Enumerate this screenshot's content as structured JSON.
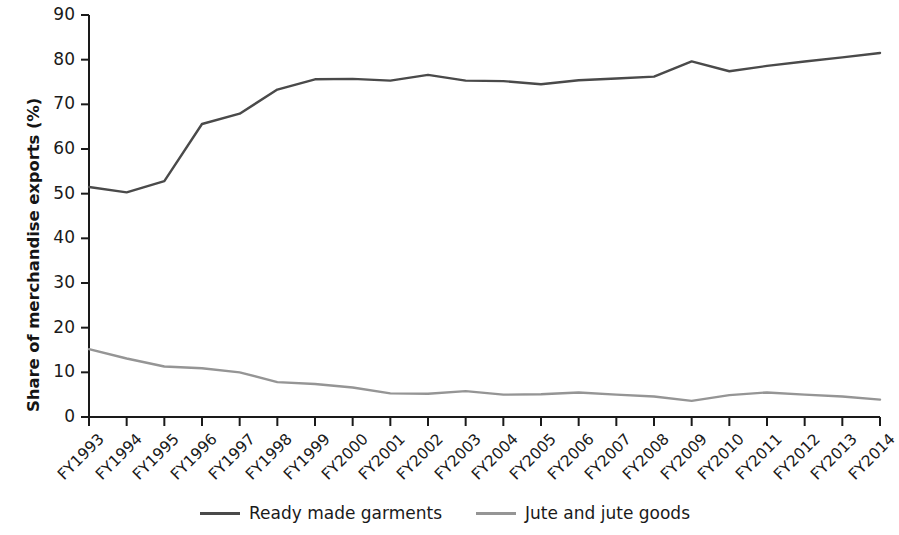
{
  "chart_data": {
    "type": "line",
    "title": "",
    "xlabel": "",
    "ylabel": "Share of merchandise exports (%)",
    "ylim": [
      0,
      90
    ],
    "yticks": [
      0,
      10,
      20,
      30,
      40,
      50,
      60,
      70,
      80,
      90
    ],
    "grid": false,
    "legend_position": "bottom-center",
    "categories": [
      "FY1993",
      "FY1994",
      "FY1995",
      "FY1996",
      "FY1997",
      "FY1998",
      "FY1999",
      "FY2000",
      "FY2001",
      "FY2002",
      "FY2003",
      "FY2004",
      "FY2005",
      "FY2006",
      "FY2007",
      "FY2008",
      "FY2009",
      "FY2010",
      "FY2011",
      "FY2012",
      "FY2013",
      "FY2014"
    ],
    "series": [
      {
        "name": "Ready made garments",
        "color": "#4a4a4a",
        "values": [
          51.5,
          50.3,
          52.8,
          65.6,
          67.9,
          73.3,
          75.6,
          75.7,
          75.3,
          76.6,
          75.3,
          75.2,
          74.5,
          75.4,
          75.8,
          76.2,
          79.6,
          77.4,
          78.6,
          79.6,
          80.5,
          81.5
        ]
      },
      {
        "name": "Jute and jute goods",
        "color": "#959595",
        "values": [
          15.2,
          13.1,
          11.3,
          10.9,
          10.0,
          7.8,
          7.4,
          6.6,
          5.3,
          5.2,
          5.8,
          5.0,
          5.1,
          5.5,
          5.0,
          4.6,
          3.6,
          4.9,
          5.5,
          5.0,
          4.6,
          3.9
        ]
      }
    ]
  },
  "legend": {
    "items": [
      {
        "label": "Ready made garments",
        "color": "#4a4a4a"
      },
      {
        "label": "Jute and jute goods",
        "color": "#959595"
      }
    ]
  },
  "axes": {
    "y_title": "Share of merchandise exports (%)"
  }
}
